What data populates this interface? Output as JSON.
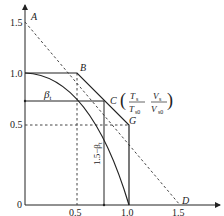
{
  "diagram": {
    "x_axis": {
      "label_num": "T",
      "label_num_sub": "s",
      "label_den": "T",
      "label_den_sub": "s0",
      "ticks": [
        "0.5",
        "1.0",
        "1.5"
      ]
    },
    "y_axis": {
      "ticks": [
        "0",
        "0.5",
        "1.0",
        "1.5"
      ]
    },
    "points": {
      "A": "A",
      "B": "B",
      "C": "C",
      "D": "D",
      "G": "G"
    },
    "c_annotation": {
      "open": "(",
      "frac1_num": "T",
      "frac1_num_sub": "s",
      "frac1_den": "T",
      "frac1_den_sub": "s0",
      "frac2_num": "V",
      "frac2_num_sub": "s",
      "frac2_den": "V",
      "frac2_den_sub": "s0",
      "close": ")"
    },
    "beta_label": "β",
    "beta_sub": "t",
    "vertical_label": "1.5−β",
    "vertical_label_sub": "t",
    "colors": {
      "line": "#222222",
      "dashed": "#444444"
    }
  }
}
